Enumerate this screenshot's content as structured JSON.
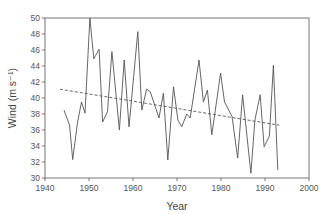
{
  "chart_data": {
    "type": "line",
    "title": "",
    "xlabel": "Year",
    "ylabel": "Wind (m s⁻¹)",
    "xlim": [
      1940,
      2000
    ],
    "ylim": [
      30,
      50
    ],
    "xticks": [
      1940,
      1950,
      1960,
      1970,
      1980,
      1990,
      2000
    ],
    "yticks": [
      30,
      32,
      34,
      36,
      38,
      40,
      42,
      44,
      46,
      48,
      50
    ],
    "grid": false,
    "legend": null,
    "series": [
      {
        "name": "Wind",
        "style": "solid",
        "color": "#555555",
        "x": [
          1944.3,
          1945.6,
          1946.3,
          1947.4,
          1948.3,
          1949.1,
          1950.2,
          1951.1,
          1952.3,
          1953.1,
          1954.2,
          1955.2,
          1956.9,
          1958.0,
          1959.1,
          1961.1,
          1962.0,
          1963.1,
          1963.9,
          1965.9,
          1966.9,
          1967.9,
          1969.2,
          1970.2,
          1971.1,
          1972.2,
          1973.0,
          1975.0,
          1976.0,
          1976.9,
          1977.9,
          1979.9,
          1980.8,
          1982.5,
          1983.8,
          1984.9,
          1986.8,
          1987.7,
          1988.9,
          1989.8,
          1991.0,
          1991.9,
          1992.9
        ],
        "y": [
          38.5,
          36.6,
          32.3,
          37.0,
          39.5,
          38.1,
          50.0,
          44.9,
          46.1,
          37.0,
          38.3,
          45.8,
          36.0,
          44.75,
          36.4,
          48.3,
          38.5,
          41.1,
          40.8,
          37.5,
          40.6,
          32.25,
          41.4,
          37.25,
          36.4,
          38.0,
          37.5,
          44.75,
          39.5,
          41.0,
          35.4,
          43.1,
          39.5,
          37.7,
          32.5,
          40.4,
          30.6,
          37.25,
          40.4,
          33.9,
          35.25,
          44.1,
          31.0
        ]
      },
      {
        "name": "Linear trend",
        "style": "dashed",
        "color": "#555555",
        "x": [
          1943.4,
          1993.2
        ],
        "y": [
          41.1,
          36.6
        ]
      }
    ],
    "plot_area_px": {
      "left": 45,
      "top": 18,
      "right": 309,
      "bottom": 178
    }
  },
  "labels": {
    "xlabel": "Year",
    "ylabel": "Wind (m s⁻¹)"
  }
}
